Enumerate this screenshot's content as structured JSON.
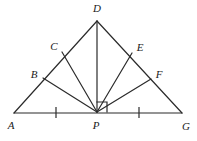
{
  "figure": {
    "kind": "geometry-diagram",
    "canvas": {
      "width": 197,
      "height": 141
    },
    "stroke_color": "#2b2b2b",
    "label_color": "#1a1a1a",
    "background_color": "#ffffff",
    "stroke_width": 1.2
  },
  "points": {
    "A": {
      "label": "A",
      "x": 14,
      "y": 113,
      "label_x": 11,
      "label_y": 125
    },
    "B": {
      "label": "B",
      "x": 43,
      "y": 78,
      "label_x": 34,
      "label_y": 74
    },
    "C": {
      "label": "C",
      "x": 62,
      "y": 52,
      "label_x": 54,
      "label_y": 46
    },
    "D": {
      "label": "D",
      "x": 97,
      "y": 21,
      "label_x": 97,
      "label_y": 8
    },
    "E": {
      "label": "E",
      "x": 132,
      "y": 53,
      "label_x": 140,
      "label_y": 47
    },
    "F": {
      "label": "F",
      "x": 151,
      "y": 79,
      "label_x": 159,
      "label_y": 74
    },
    "G": {
      "label": "G",
      "x": 182,
      "y": 113,
      "label_x": 186,
      "label_y": 126
    },
    "P": {
      "label": "P",
      "x": 97,
      "y": 112,
      "label_x": 96,
      "label_y": 125
    }
  },
  "segments": [
    {
      "name": "base-AG",
      "from": "A",
      "to": "G"
    },
    {
      "name": "side-AD",
      "from": "A",
      "to": "D"
    },
    {
      "name": "side-DG",
      "from": "D",
      "to": "G"
    },
    {
      "name": "cevian-PB",
      "from": "P",
      "to": "B"
    },
    {
      "name": "cevian-PC",
      "from": "P",
      "to": "C"
    },
    {
      "name": "altitude-PD",
      "from": "P",
      "to": "D"
    },
    {
      "name": "cevian-PE",
      "from": "P",
      "to": "E"
    },
    {
      "name": "cevian-PF",
      "from": "P",
      "to": "F"
    }
  ],
  "tick_marks": [
    {
      "name": "tick-AP",
      "x": 56,
      "y1": 108,
      "y2": 118
    },
    {
      "name": "tick-PG",
      "x": 139,
      "y1": 108,
      "y2": 118
    }
  ],
  "right_angle": {
    "name": "right-angle-at-P",
    "vertex": "P",
    "x": 97,
    "y": 112,
    "size": 10,
    "direction": "up-right"
  }
}
